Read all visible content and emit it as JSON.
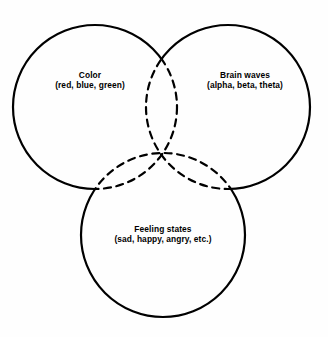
{
  "figure": {
    "type": "venn-diagram-3-set",
    "background_color": "#fefefe",
    "stroke_color": "#000000",
    "outer_arc_style": "solid",
    "inner_arc_style": "dashed"
  },
  "sets": [
    {
      "id": "color",
      "title": "Color",
      "examples": "(red, blue, green)",
      "position": "top-left",
      "center_x": 95,
      "center_y": 107,
      "radius": 82,
      "label_x": 90,
      "label_y": 80
    },
    {
      "id": "brain-waves",
      "title": "Brain waves",
      "examples": "(alpha, beta, theta)",
      "position": "top-right",
      "center_x": 228,
      "center_y": 107,
      "radius": 82,
      "label_x": 245,
      "label_y": 80
    },
    {
      "id": "feeling-states",
      "title": "Feeling states",
      "examples": "(sad, happy, angry, etc.)",
      "position": "bottom-center",
      "center_x": 163,
      "center_y": 235,
      "radius": 82,
      "label_x": 163,
      "label_y": 234
    }
  ],
  "chart_data": {
    "type": "venn",
    "title": "",
    "sets": [
      "Color",
      "Brain waves",
      "Feeling states"
    ],
    "set_examples": [
      "(red, blue, green)",
      "(alpha, beta, theta)",
      "(sad, happy, angry, etc.)"
    ],
    "circle_count": 3,
    "all_regions_overlap": true,
    "legend": "none",
    "grid": false
  }
}
